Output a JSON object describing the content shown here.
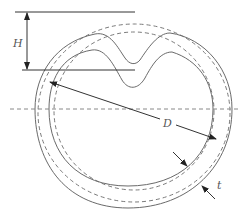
{
  "diagram": {
    "title": "",
    "labels": {
      "height": "H",
      "diameter": "D",
      "thickness": "t"
    },
    "colors": {
      "solid_outline": "#6a6a6a",
      "dashed_circle": "#7a7a7a",
      "dimension": "#333333"
    }
  }
}
